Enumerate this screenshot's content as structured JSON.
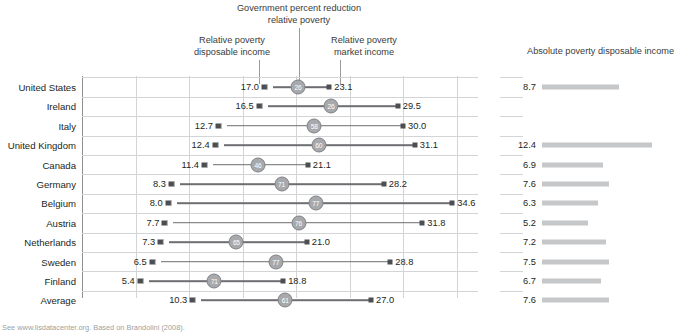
{
  "annotations": {
    "gov_reduction": "Government percent reduction\nrelative poverty",
    "rel_disposable": "Relative poverty\ndisposable income",
    "rel_market": "Relative poverty\nmarket income",
    "panel_right_title": "Absolute poverty disposable income"
  },
  "source": "See www.lisdatacenter.org. Based on Brandolini (2008).",
  "colors": {
    "marker": "#4d4e52",
    "connector": "#6d6e71",
    "bubble_fill": "#a7a9ac",
    "bubble_text": "#ffffff",
    "bar": "#c6c7c9",
    "grid": "#d2d4d6",
    "axis": "#8d9092",
    "text": "#231f20"
  },
  "chart_data": {
    "type": "scatter",
    "title": "",
    "xlabel": "",
    "ylabel": "",
    "xlim": [
      0,
      37
    ],
    "xticks": [
      0,
      5,
      10,
      15,
      20,
      25,
      30,
      35
    ],
    "grid": true,
    "legend_position": "top-annotations",
    "categories": [
      "United States",
      "Ireland",
      "Italy",
      "United Kingdom",
      "Canada",
      "Germany",
      "Belgium",
      "Austria",
      "Netherlands",
      "Sweden",
      "Finland",
      "Average"
    ],
    "series": [
      {
        "name": "Relative poverty disposable income",
        "values": [
          17.0,
          16.5,
          12.7,
          12.4,
          11.4,
          8.3,
          8.0,
          7.7,
          7.3,
          6.5,
          5.4,
          10.3
        ]
      },
      {
        "name": "Relative poverty market income",
        "values": [
          23.1,
          29.5,
          30.0,
          31.1,
          21.1,
          28.2,
          34.6,
          31.8,
          21.0,
          28.8,
          18.8,
          27.0
        ]
      },
      {
        "name": "Government percent reduction relative poverty",
        "values": [
          26,
          26,
          58,
          60,
          46,
          71,
          77,
          76,
          65,
          77,
          71,
          61
        ]
      },
      {
        "name": "Absolute poverty disposable income",
        "values": [
          8.7,
          null,
          null,
          12.4,
          6.9,
          7.6,
          6.3,
          5.2,
          7.2,
          7.5,
          6.7,
          7.6
        ]
      }
    ]
  }
}
